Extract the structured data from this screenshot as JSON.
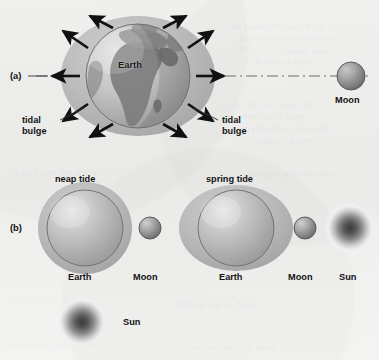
{
  "figure": {
    "background_color": "#f2f2f0",
    "ink_color": "#141414"
  },
  "panel_a": {
    "key": "(a)",
    "earth_label": "Earth",
    "moon_label": "Moon",
    "tidal_bulge_left_line1": "tidal",
    "tidal_bulge_left_line2": "bulge",
    "tidal_bulge_right_line1": "tidal",
    "tidal_bulge_right_line2": "bulge",
    "axis_style": "dash-dot",
    "arrow_count": 8,
    "arrow_color": "#111111",
    "bulge_color": "#b9b9b9",
    "globe_land_color": "#7f7f7f",
    "globe_ocean_color": "#c6c6c6"
  },
  "panel_b": {
    "key": "(b)",
    "neap_title": "neap tide",
    "spring_title": "spring tide",
    "neap": {
      "earth_label": "Earth",
      "moon_label": "Moon",
      "sun_label": "Sun",
      "bulge_orientation": "vertical"
    },
    "spring": {
      "earth_label": "Earth",
      "moon_label": "Moon",
      "sun_label": "Sun",
      "bulge_orientation": "horizontal"
    },
    "sun_color": "#4a4a4a",
    "sun_halo_color": "#d8d8d8",
    "body_color": "#aeaeae"
  },
  "ghost_text": [
    "the ocean tides rise and fall",
    "gravitational attraction of the",
    "Moon is the dominant cause",
    "of the tides on Earth",
    "the Sun also raises tides",
    "about half as strong",
    "when aligned the effects add",
    "producing spring tides",
    "at quadrature they oppose",
    "giving weaker neap tides",
    "twice each lunar month",
    "the bulge lags the Moon",
    "because of friction in the",
    "shallow seas and ocean basins"
  ]
}
